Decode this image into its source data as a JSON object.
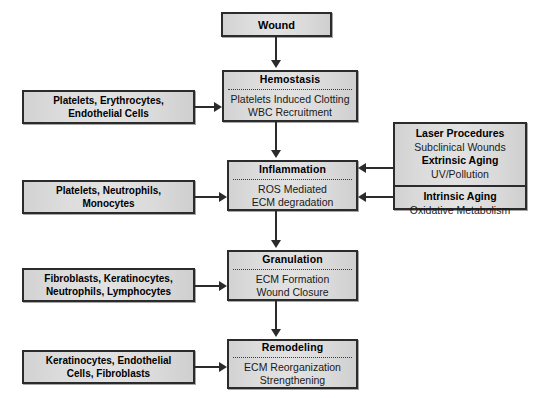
{
  "diagram": {
    "colors": {
      "box_border": "#2b2b2b",
      "box_fill": "#dcdcdc",
      "connector": "#2b2b2b",
      "background": "#ffffff"
    },
    "start": {
      "label": "Wound"
    },
    "stages": [
      {
        "id": "hemostasis",
        "title": "Hemostasis",
        "body_lines": [
          "Platelets Induced Clotting",
          "WBC Recruitment"
        ]
      },
      {
        "id": "inflammation",
        "title": "Inflammation",
        "body_lines": [
          "ROS Mediated",
          "ECM degradation"
        ]
      },
      {
        "id": "granulation",
        "title": "Granulation",
        "body_lines": [
          "ECM Formation",
          "Wound Closure"
        ]
      },
      {
        "id": "remodeling",
        "title": "Remodeling",
        "body_lines": [
          "ECM Reorganization",
          "Strengthening"
        ]
      }
    ],
    "cell_sources": [
      {
        "id": "cells-hemostasis",
        "lines": [
          "Platelets, Erythrocytes,",
          "Endothelial Cells"
        ],
        "target": "hemostasis"
      },
      {
        "id": "cells-inflammation",
        "lines": [
          "Platelets, Neutrophils,",
          "Monocytes"
        ],
        "target": "inflammation"
      },
      {
        "id": "cells-granulation",
        "lines": [
          "Fibroblasts, Keratinocytes,",
          "Neutrophils, Lymphocytes"
        ],
        "target": "granulation"
      },
      {
        "id": "cells-remodeling",
        "lines": [
          "Keratinocytes, Endothelial",
          "Cells, Fibroblasts"
        ],
        "target": "remodeling"
      }
    ],
    "factors": {
      "id": "aging-factors",
      "target": "inflammation",
      "extrinsic": {
        "heading_1": "Laser Procedures",
        "detail_1": "Subclinical Wounds",
        "heading_2": "Extrinsic Aging",
        "detail_2": "UV/Pollution"
      },
      "intrinsic": {
        "heading": "Intrinsic Aging",
        "detail": "Oxidative Metabolism"
      }
    }
  }
}
